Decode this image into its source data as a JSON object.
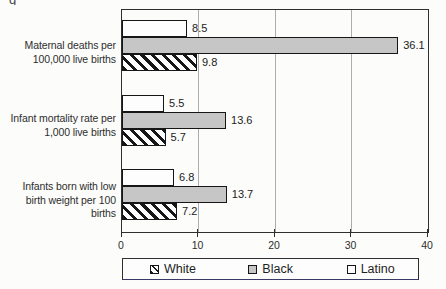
{
  "caption_fragment": "g",
  "colors": {
    "background": "#fcfcfa",
    "bar_gray": "#c6c6c6",
    "bar_white": "#fdfdfd",
    "hatch_black": "#161616",
    "plot_border": "#2f2f2f",
    "gridline": "#adadad",
    "text": "#2e2e2e"
  },
  "chart_data": {
    "type": "bar",
    "orientation": "horizontal",
    "title": "",
    "xlabel": "",
    "ylabel": "",
    "categories": [
      "Maternal deaths per 100,000 live births",
      "Infant mortality rate per 1,000 live births",
      "Infants born with low birth weight per 100 births"
    ],
    "category_lines": [
      [
        "Maternal deaths per",
        "100,000 live births"
      ],
      [
        "Infant mortality rate per",
        "1,000 live births"
      ],
      [
        "Infants born with low",
        "birth weight per 100",
        "births"
      ]
    ],
    "series": [
      {
        "name": "Latino",
        "style": "white",
        "values": [
          8.5,
          5.5,
          6.8
        ]
      },
      {
        "name": "Black",
        "style": "gray",
        "values": [
          36.1,
          13.6,
          13.7
        ]
      },
      {
        "name": "White",
        "style": "hatch",
        "values": [
          9.8,
          5.7,
          7.2
        ]
      }
    ],
    "xlim": [
      0,
      40
    ],
    "xticks": [
      0,
      10,
      20,
      30,
      40
    ],
    "grid": true,
    "value_labels": true,
    "legend": {
      "position": "bottom",
      "entries": [
        {
          "label": "White",
          "style": "hatch"
        },
        {
          "label": "Black",
          "style": "gray"
        },
        {
          "label": "Latino",
          "style": "white"
        }
      ]
    }
  }
}
